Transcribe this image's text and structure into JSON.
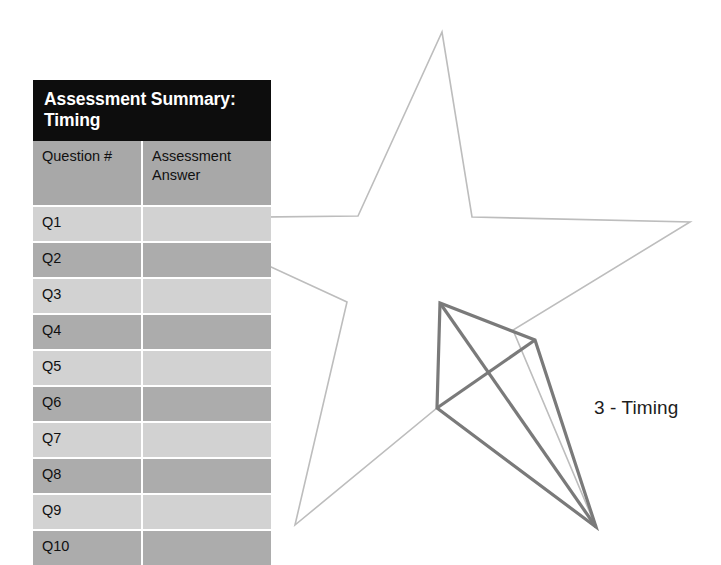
{
  "table": {
    "title": "Assessment Summary: Timing",
    "columns": [
      "Question #",
      "Assessment Answer"
    ],
    "rows": [
      {
        "question": "Q1",
        "answer": ""
      },
      {
        "question": "Q2",
        "answer": ""
      },
      {
        "question": "Q3",
        "answer": ""
      },
      {
        "question": "Q4",
        "answer": ""
      },
      {
        "question": "Q5",
        "answer": ""
      },
      {
        "question": "Q6",
        "answer": ""
      },
      {
        "question": "Q7",
        "answer": ""
      },
      {
        "question": "Q8",
        "answer": ""
      },
      {
        "question": "Q9",
        "answer": ""
      },
      {
        "question": "Q10",
        "answer": ""
      }
    ],
    "colors": {
      "title_background": "#0d0d0d",
      "title_text": "#ffffff",
      "header_background": "#a8a8a8",
      "row_light": "#d2d2d2",
      "row_dark": "#acacac",
      "text": "#111111",
      "gridline": "#ffffff"
    }
  },
  "diagram": {
    "label": "3 - Timing",
    "label_color": "#1d1d1d",
    "star": {
      "name": "five-pointed-star-outline",
      "stroke": "#bdbdbd",
      "stroke_width": 1.6,
      "fill": "none",
      "points": "442,32 472,217 690,222 513,330 596,527 437,408 295,525 347,302 165,218 358,216"
    },
    "kite": {
      "name": "kite-quadrilateral",
      "stroke": "#7a7a7a",
      "stroke_width": 3.2,
      "fill": "none",
      "vertices": {
        "top": "440,303",
        "right": "535,340",
        "bottom": "596,527",
        "left": "437,408"
      },
      "edges": [
        "top-right",
        "right-bottom",
        "bottom-left",
        "left-top",
        "top-bottom",
        "left-right"
      ]
    }
  }
}
